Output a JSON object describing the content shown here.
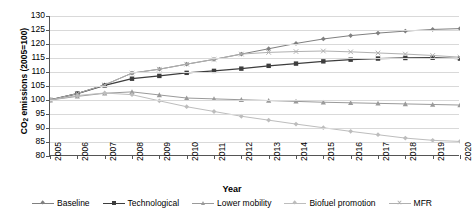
{
  "chart_data": {
    "type": "line",
    "title": "",
    "xlabel": "Year",
    "ylabel": "CO2 emissions (2005=100)",
    "ylabel_prefix": "CO",
    "ylabel_sub": "2",
    "ylabel_suffix": " emissions (2005=100)",
    "x": [
      2005,
      2006,
      2007,
      2008,
      2009,
      2010,
      2011,
      2012,
      2013,
      2014,
      2015,
      2016,
      2017,
      2018,
      2019,
      2020
    ],
    "xtick_labels": [
      "2005",
      "2006",
      "2007",
      "2008",
      "2009",
      "2010",
      "2011",
      "2012",
      "2013",
      "2014",
      "2015",
      "2016",
      "2017",
      "2018",
      "2019",
      "2020"
    ],
    "ytick_labels": [
      "130",
      "125",
      "120",
      "115",
      "110",
      "105",
      "100",
      "95",
      "90",
      "85",
      "80"
    ],
    "yticks": [
      130,
      125,
      120,
      115,
      110,
      105,
      100,
      95,
      90,
      85,
      80
    ],
    "ylim": [
      80,
      130
    ],
    "xlim": [
      2005,
      2020
    ],
    "grid": true,
    "legend_position": "bottom",
    "series": [
      {
        "name": "Baseline",
        "color": "#808080",
        "marker": "diamond",
        "values": [
          100.0,
          102.3,
          105.4,
          109.6,
          111.0,
          112.8,
          114.5,
          116.4,
          118.3,
          120.2,
          121.8,
          123.0,
          123.9,
          124.6,
          125.2,
          125.5
        ]
      },
      {
        "name": "Technological",
        "color": "#3d3d3d",
        "marker": "square",
        "values": [
          100.0,
          102.3,
          105.2,
          107.6,
          108.6,
          109.7,
          110.4,
          111.2,
          112.2,
          113.0,
          113.8,
          114.4,
          114.8,
          115.0,
          115.1,
          114.8
        ]
      },
      {
        "name": "Lower mobility",
        "color": "#9a9a9a",
        "marker": "triangle",
        "values": [
          100.0,
          101.3,
          102.4,
          102.9,
          101.8,
          100.7,
          100.4,
          100.1,
          99.8,
          99.5,
          99.2,
          99.0,
          98.8,
          98.6,
          98.4,
          98.2
        ]
      },
      {
        "name": "Biofuel promotion",
        "color": "#bdbdbd",
        "marker": "diamond",
        "values": [
          100.0,
          101.6,
          102.5,
          101.9,
          99.7,
          97.6,
          95.9,
          94.2,
          92.8,
          91.4,
          90.1,
          88.8,
          87.6,
          86.4,
          85.6,
          85.2
        ]
      },
      {
        "name": "MFR",
        "color": "#b0b0b0",
        "marker": "x",
        "values": [
          100.0,
          102.3,
          105.4,
          109.6,
          111.0,
          112.8,
          114.5,
          116.4,
          117.0,
          117.3,
          117.5,
          117.2,
          116.8,
          116.4,
          115.9,
          115.3
        ]
      }
    ]
  }
}
